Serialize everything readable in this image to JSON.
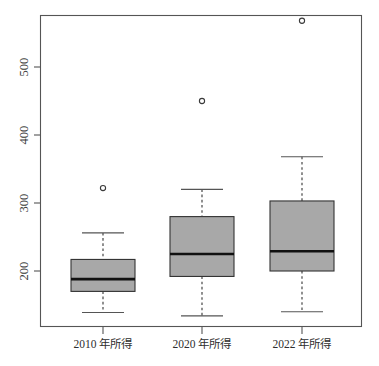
{
  "chart_data": {
    "type": "boxplot",
    "title": "",
    "subtitle": "",
    "xlabel": "",
    "ylabel": "",
    "grid": false,
    "legend": "none",
    "y_axis": {
      "ticks": [
        200,
        300,
        400,
        500
      ],
      "tick_labels": [
        "200",
        "300",
        "400",
        "500"
      ],
      "ylim": [
        124,
        584
      ],
      "label_rotation": -90
    },
    "x_axis": {
      "categories": [
        "2010 年所得",
        "2020 年所得",
        "2022 年所得"
      ]
    },
    "boxes": [
      {
        "category": "2010 年所得",
        "whisker_low": 139,
        "q1": 170,
        "median": 188,
        "q3": 217,
        "whisker_high": 256,
        "outliers": [
          322
        ]
      },
      {
        "category": "2020 年所得",
        "whisker_low": 134,
        "q1": 192,
        "median": 225,
        "q3": 280,
        "whisker_high": 320,
        "outliers": [
          450
        ]
      },
      {
        "category": "2022 年所得",
        "whisker_low": 140,
        "q1": 200,
        "median": 229,
        "q3": 303,
        "whisker_high": 368,
        "outliers": [
          568
        ]
      }
    ],
    "colors": {
      "box_fill": "#a8a8a8",
      "box_stroke": "#333333",
      "median": "#111111",
      "whisker": "#555555",
      "frame": "#555555",
      "text": "#2e2e2e",
      "background": "#ffffff"
    }
  }
}
